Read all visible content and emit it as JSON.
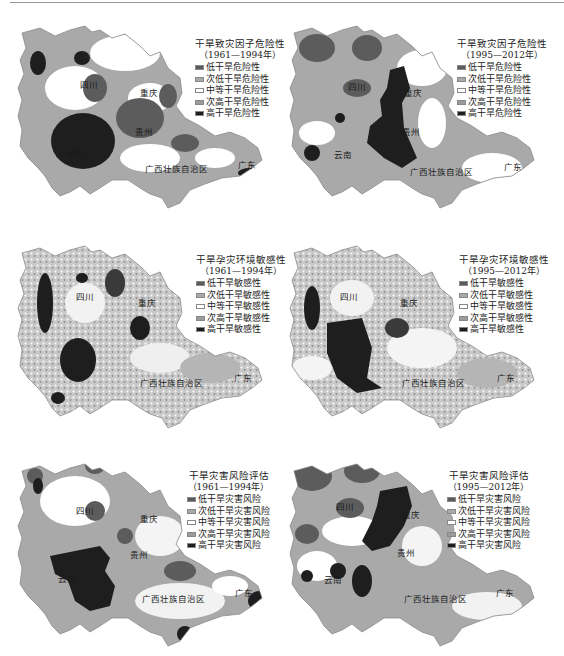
{
  "colors": {
    "low": "#5c5c5c",
    "sub_low": "#a9a9a9",
    "medium": "#ffffff",
    "sub_high": "#9b9b9b",
    "high": "#1e1e1e",
    "border": "#8a8a8a"
  },
  "panels": [
    {
      "title": "干旱致灾因子危险性",
      "period": "（1961—1994年）",
      "legend": [
        "低干旱危险性",
        "次低干旱危险性",
        "中等干旱危险性",
        "次高干旱危险性",
        "高干旱危险性"
      ],
      "provinces": {
        "sichuan": "四川",
        "chongqing": "重庆",
        "guizhou": "贵州",
        "yunnan": "云南",
        "guangxi": "广西壮族自治区",
        "guangdong": "广东"
      }
    },
    {
      "title": "干旱致灾因子危险性",
      "period": "（1995—2012年）",
      "legend": [
        "低干旱危险性",
        "次低干旱危险性",
        "中等干旱危险性",
        "次高干旱危险性",
        "高干旱危险性"
      ],
      "provinces": {
        "sichuan": "四川",
        "chongqing": "重庆",
        "guizhou": "贵州",
        "yunnan": "云南",
        "guangxi": "广西壮族自治区",
        "guangdong": "广东"
      }
    },
    {
      "title": "干旱孕灾环境敏感性",
      "period": "（1961—1994年）",
      "legend": [
        "低干旱敏感性",
        "次低干旱敏感性",
        "中等干旱敏感性",
        "次高干旱敏感性",
        "高干旱敏感性"
      ],
      "provinces": {
        "sichuan": "四川",
        "chongqing": "重庆",
        "guizhou": "贵州",
        "yunnan": "云南",
        "guangxi": "广西壮族自治区",
        "guangdong": "广东"
      }
    },
    {
      "title": "干旱孕灾环境敏感性",
      "period": "（1995—2012年）",
      "legend": [
        "低干旱敏感性",
        "次低干旱敏感性",
        "中等干旱敏感性",
        "次高干旱敏感性",
        "高干旱敏感性"
      ],
      "provinces": {
        "sichuan": "四川",
        "chongqing": "重庆",
        "guizhou": "贵州",
        "yunnan": "云南",
        "guangxi": "广西壮族自治区",
        "guangdong": "广东"
      }
    },
    {
      "title": "干旱灾害风险评估",
      "period": "（1961—1994年）",
      "legend": [
        "低干旱灾害风险",
        "次低干旱灾害风险",
        "中等干旱灾害风险",
        "次高干旱灾害风险",
        "高干旱灾害风险"
      ],
      "provinces": {
        "sichuan": "四川",
        "chongqing": "重庆",
        "guizhou": "贵州",
        "yunnan": "云南",
        "guangxi": "广西壮族自治区",
        "guangdong": "广东"
      }
    },
    {
      "title": "干旱灾害风险评估",
      "period": "（1995—2012年）",
      "legend": [
        "低干旱灾害风险",
        "次低干旱灾害风险",
        "中等干旱灾害风险",
        "次高干旱灾害风险",
        "高干旱灾害风险"
      ],
      "provinces": {
        "sichuan": "四川",
        "chongqing": "重庆",
        "guizhou": "贵州",
        "yunnan": "云南",
        "guangxi": "广西壮族自治区",
        "guangdong": "广东"
      }
    }
  ]
}
